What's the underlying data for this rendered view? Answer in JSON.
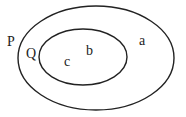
{
  "diagram": {
    "type": "venn-nested-sets",
    "sets": [
      {
        "name": "P",
        "label": "P",
        "contains": [
          "Q",
          "a"
        ]
      },
      {
        "name": "Q",
        "label": "Q",
        "contains": [
          "b",
          "c"
        ]
      }
    ],
    "elements": {
      "a": "a",
      "b": "b",
      "c": "c"
    },
    "colors": {
      "stroke": "#222222",
      "background": "#ffffff"
    }
  }
}
